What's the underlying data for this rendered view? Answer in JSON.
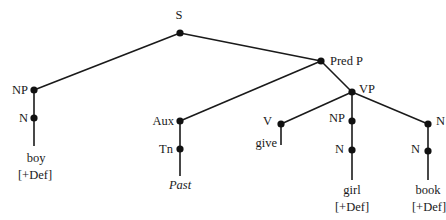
{
  "diagram": {
    "type": "syntax-tree",
    "nodes": {
      "S": {
        "label": "S"
      },
      "NP_subj": {
        "label": "NP"
      },
      "N_subj": {
        "label": "N"
      },
      "PredP": {
        "label": "Pred P"
      },
      "Aux": {
        "label": "Aux"
      },
      "Tn": {
        "label": "Tn"
      },
      "VP": {
        "label": "VP"
      },
      "V": {
        "label": "V"
      },
      "NP_io": {
        "label": "NP"
      },
      "N_io": {
        "label": "N"
      },
      "NP_do": {
        "label": "N"
      },
      "N_do": {
        "label": "N"
      }
    },
    "leaves": {
      "boy": {
        "word": "boy",
        "feature": "[+Def]"
      },
      "past": {
        "word": "Past"
      },
      "give": {
        "word": "give"
      },
      "girl": {
        "word": "girl",
        "feature": "[+Def]"
      },
      "book": {
        "word": "book",
        "feature": "[+Def]"
      }
    },
    "edges": [
      [
        "S",
        "NP"
      ],
      [
        "S",
        "Pred P"
      ],
      [
        "NP",
        "N"
      ],
      [
        "N",
        "boy [+Def]"
      ],
      [
        "Pred P",
        "Aux"
      ],
      [
        "Pred P",
        "VP"
      ],
      [
        "Aux",
        "Tn"
      ],
      [
        "Tn",
        "Past"
      ],
      [
        "VP",
        "V"
      ],
      [
        "VP",
        "NP"
      ],
      [
        "VP",
        "NP"
      ],
      [
        "V",
        "give"
      ],
      [
        "NP",
        "N"
      ],
      [
        "N",
        "girl [+Def]"
      ],
      [
        "NP",
        "N"
      ],
      [
        "N",
        "book [+Def]"
      ]
    ]
  }
}
